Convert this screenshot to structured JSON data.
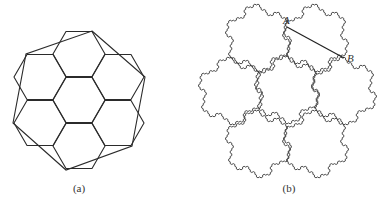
{
  "figure_a": {
    "caption": "(a)",
    "caption_pos": [
      79,
      188
    ],
    "stroke": "#2b2b2b",
    "hex_side": 26,
    "hex_centers": [
      [
        79,
        100
      ],
      [
        79,
        54
      ],
      [
        79,
        146
      ],
      [
        40,
        77
      ],
      [
        118,
        77
      ],
      [
        40,
        123
      ],
      [
        118,
        123
      ]
    ],
    "outer_polygon": [
      [
        92,
        31
      ],
      [
        145,
        77
      ],
      [
        132,
        146
      ],
      [
        66,
        170
      ],
      [
        13,
        123
      ],
      [
        26,
        54
      ]
    ]
  },
  "figure_b": {
    "caption": "(b)",
    "caption_pos": [
      289,
      188
    ],
    "stroke": "#3a3a3a",
    "tile_radius": 33,
    "tile_centers": [
      [
        287,
        90
      ],
      [
        258,
        38
      ],
      [
        316,
        38
      ],
      [
        344,
        91
      ],
      [
        231,
        91
      ],
      [
        258,
        144
      ],
      [
        316,
        144
      ]
    ],
    "recursion_depth": 3,
    "segment": {
      "from_label": "A",
      "to_label": "B",
      "from": [
        287,
        27
      ],
      "to": [
        344,
        58
      ]
    },
    "labels": [
      {
        "text": "A",
        "pos": [
          283,
          14
        ]
      },
      {
        "text": "B",
        "pos": [
          347,
          52
        ]
      }
    ]
  }
}
